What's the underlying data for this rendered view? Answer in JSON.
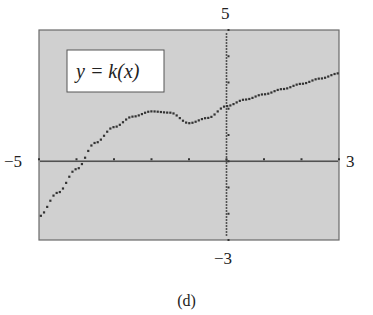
{
  "chart_data": {
    "type": "scatter",
    "title": "y = k(x)",
    "caption": "(d)",
    "xlabel": "",
    "ylabel": "",
    "xlim": [
      -5,
      3
    ],
    "ylim": [
      -3,
      5
    ],
    "axis_labels": {
      "x_min": "−5",
      "x_max": "3",
      "y_max": "5",
      "y_min": "−3"
    },
    "grid": false,
    "tick_marks_every": 1,
    "x": [
      -5,
      -4.5,
      -4,
      -3.5,
      -3,
      -2.5,
      -2,
      -1.5,
      -1,
      -0.5,
      0,
      0.5,
      1,
      1.5,
      2,
      2.5,
      3
    ],
    "y": [
      -2.1,
      -1.2,
      -0.3,
      0.7,
      1.3,
      1.7,
      1.9,
      1.85,
      1.45,
      1.65,
      2.1,
      2.35,
      2.55,
      2.75,
      2.95,
      3.15,
      3.35
    ],
    "background_color": "#cfcfcf",
    "point_color": "#333333"
  },
  "labels": {
    "function": "y = k(x)",
    "x_min": "−5",
    "x_max": "3",
    "y_max": "5",
    "y_min": "−3",
    "caption": "(d)"
  }
}
